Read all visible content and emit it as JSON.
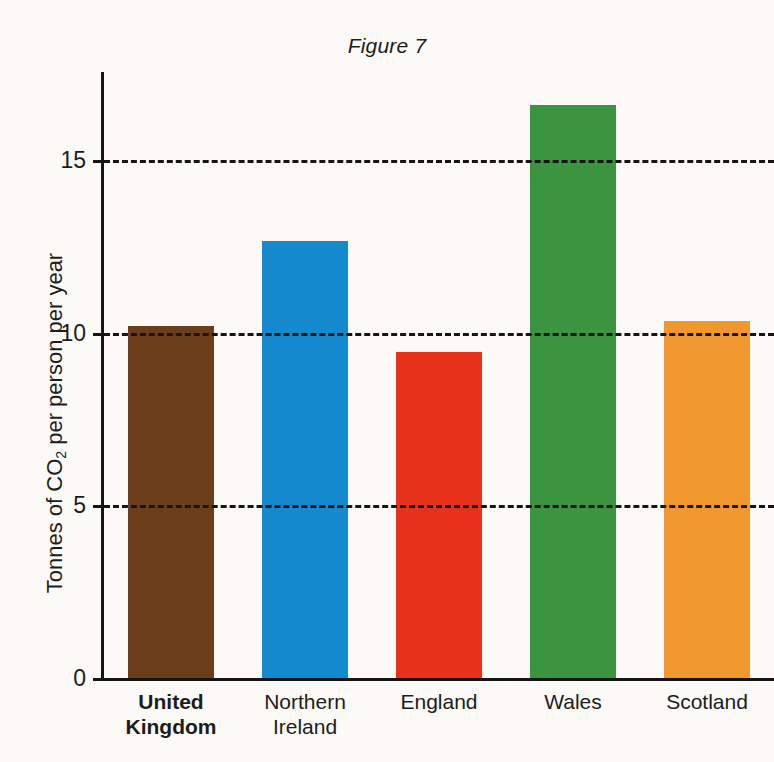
{
  "figure": {
    "title": "Figure 7"
  },
  "chart_data": {
    "type": "bar",
    "title": "Figure 7",
    "xlabel": "",
    "ylabel": "Tonnes of CO2 per person per year",
    "ylabel_parts": {
      "before": "Tonnes of CO",
      "subscript": "2",
      "after": " per person per year"
    },
    "categories": [
      "United Kingdom",
      "Northern Ireland",
      "England",
      "Wales",
      "Scotland"
    ],
    "category_lines": [
      [
        "United",
        "Kingdom"
      ],
      [
        "Northern",
        "Ireland"
      ],
      [
        "England"
      ],
      [
        "Wales"
      ],
      [
        "Scotland"
      ]
    ],
    "category_bold": [
      true,
      false,
      false,
      false,
      false
    ],
    "values": [
      10.2,
      12.65,
      9.45,
      16.6,
      10.35
    ],
    "colors": [
      "#6b3d1b",
      "#1489ce",
      "#e8311a",
      "#3b9440",
      "#f0972e"
    ],
    "ylim": [
      0,
      17.6
    ],
    "yticks": [
      0,
      5,
      10,
      15
    ],
    "ytick_labels": [
      "0",
      "5",
      "10",
      "15"
    ],
    "gridlines": [
      5,
      10,
      15
    ],
    "grid": true,
    "grid_style": "dashed",
    "legend": "none"
  }
}
